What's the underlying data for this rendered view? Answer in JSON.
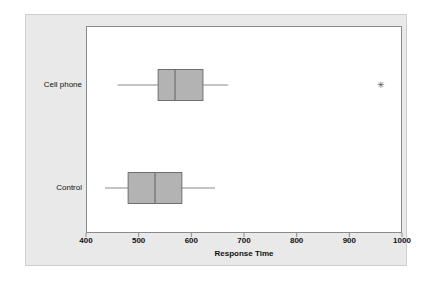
{
  "chart_data": {
    "type": "box",
    "title": "",
    "xlabel": "Response Time",
    "ylabel": "",
    "xlim": [
      400,
      1000
    ],
    "xticks": [
      400,
      500,
      600,
      700,
      800,
      900,
      1000
    ],
    "xtick_labels": [
      "400",
      "500",
      "600",
      "700",
      "800",
      "900",
      "1000"
    ],
    "grid": false,
    "legend": "none",
    "orientation": "horizontal",
    "categories": [
      "Cell phone",
      "Control"
    ],
    "boxes": [
      {
        "label": "Cell phone",
        "whisker_low": 460,
        "q1": 537,
        "median": 569,
        "q3": 622,
        "whisker_high": 670,
        "outliers": [
          960
        ]
      },
      {
        "label": "Control",
        "whisker_low": 436,
        "q1": 480,
        "median": 531,
        "q3": 582,
        "whisker_high": 645,
        "outliers": []
      }
    ],
    "colors": {
      "box_fill": "#b3b3b3",
      "box_edge": "#6e6e6e",
      "whisker": "#8a8a8a",
      "median": "#6e6e6e",
      "outlier": "#4d4d4d",
      "plot_background": "#ffffff",
      "panel_background": "#e9e9e9",
      "axis": "#8a8a8a",
      "text": "#111111"
    }
  },
  "axis": {
    "title": "Response Time",
    "tick_labels": [
      "400",
      "500",
      "600",
      "700",
      "800",
      "900",
      "1000"
    ]
  },
  "category_labels": {
    "cell_phone": "Cell phone",
    "control": "Control"
  }
}
